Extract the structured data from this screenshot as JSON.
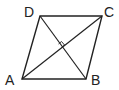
{
  "figure": {
    "type": "rhombus",
    "vertices": {
      "A": {
        "label": "A",
        "x": 22,
        "y": 79
      },
      "B": {
        "label": "B",
        "x": 86,
        "y": 79
      },
      "C": {
        "label": "C",
        "x": 102,
        "y": 16
      },
      "D": {
        "label": "D",
        "x": 40,
        "y": 16
      }
    },
    "diagonals": [
      "AC",
      "BD"
    ],
    "annotation": "right-angle marker at diagonal intersection",
    "stroke_color": "#222222"
  }
}
